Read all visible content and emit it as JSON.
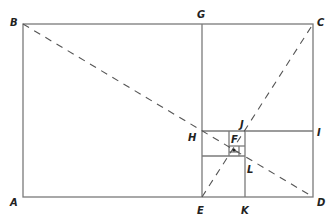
{
  "diagram": {
    "type": "golden-rectangle-subdivision",
    "colors": {
      "line": "#7a7a7a",
      "dashed": "#555555",
      "label": "#222222",
      "background": "#ffffff"
    },
    "points": {
      "A": {
        "label": "A",
        "x": 23,
        "y": 197
      },
      "B": {
        "label": "B",
        "x": 23,
        "y": 24
      },
      "C": {
        "label": "C",
        "x": 313,
        "y": 24
      },
      "D": {
        "label": "D",
        "x": 313,
        "y": 197
      },
      "G": {
        "label": "G",
        "x": 202,
        "y": 24
      },
      "E": {
        "label": "E",
        "x": 202,
        "y": 197
      },
      "H": {
        "label": "H",
        "x": 202,
        "y": 131
      },
      "I": {
        "label": "I",
        "x": 313,
        "y": 131
      },
      "K": {
        "label": "K",
        "x": 245,
        "y": 197
      },
      "J": {
        "label": "J",
        "x": 245,
        "y": 131
      },
      "L": {
        "label": "L",
        "x": 245,
        "y": 156
      },
      "F": {
        "label": "F",
        "x": 235,
        "y": 141
      }
    },
    "labels": {
      "A": "A",
      "B": "B",
      "C": "C",
      "D": "D",
      "E": "E",
      "F": "F",
      "G": "G",
      "H": "H",
      "I": "I",
      "J": "J",
      "K": "K",
      "L": "L"
    },
    "dashed_lines": [
      {
        "from": "B",
        "to": "D"
      },
      {
        "from": "E",
        "to": "C"
      }
    ]
  }
}
